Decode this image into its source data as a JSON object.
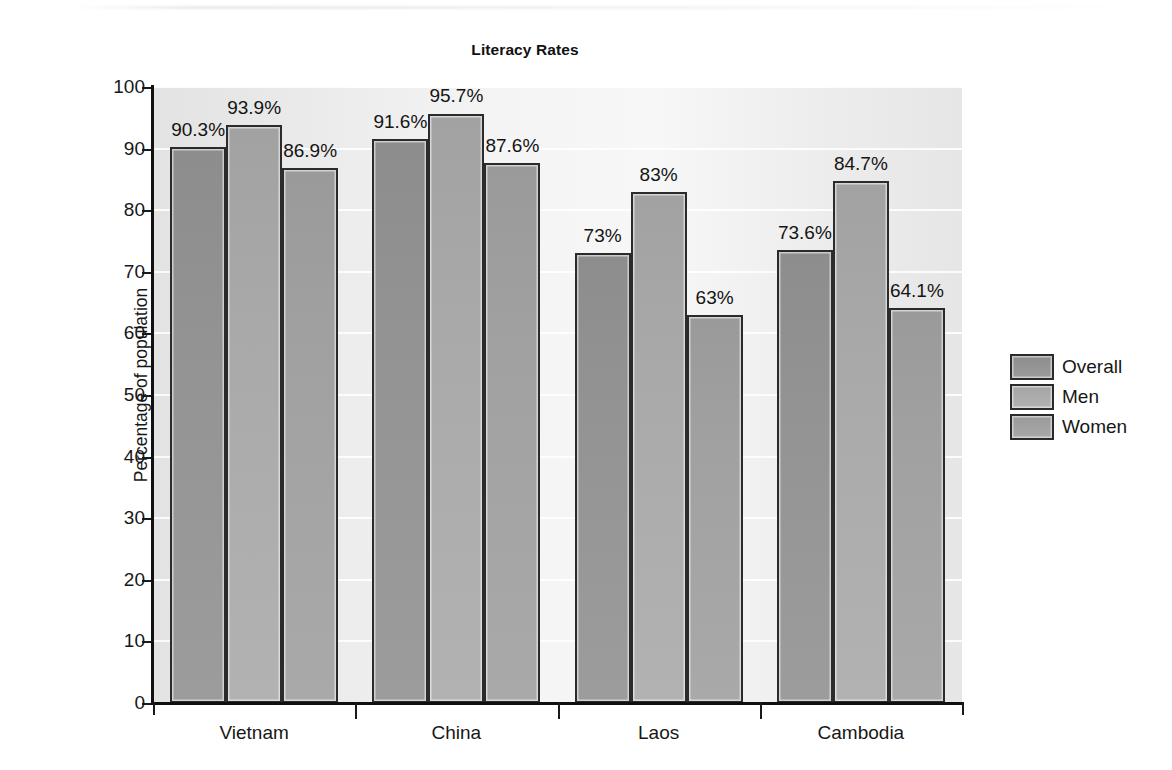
{
  "chart_data": {
    "type": "bar",
    "title": "Literacy Rates",
    "xlabel": "",
    "ylabel": "Percentage of population",
    "ylim": [
      0,
      100
    ],
    "ytick_step": 10,
    "yticks": [
      100,
      90,
      80,
      70,
      60,
      50,
      40,
      30,
      20,
      10,
      0
    ],
    "ytick_labels": [
      "100",
      "90",
      "80",
      "70",
      "60",
      "50",
      "40",
      "30",
      "20",
      "10",
      "0"
    ],
    "grid": "horizontal-white",
    "legend_position": "right",
    "categories": [
      "Vietnam",
      "China",
      "Laos",
      "Cambodia"
    ],
    "series": [
      {
        "name": "Overall",
        "color": "#939393",
        "values": [
          90.3,
          91.6,
          73,
          73.6
        ],
        "labels": [
          "90.3%",
          "91.6%",
          "73%",
          "73.6%"
        ]
      },
      {
        "name": "Men",
        "color": "#a9a9a9",
        "values": [
          93.9,
          95.7,
          83,
          84.7
        ],
        "labels": [
          "93.9%",
          "95.7%",
          "83%",
          "84.7%"
        ]
      },
      {
        "name": "Women",
        "color": "#a1a1a1",
        "values": [
          86.9,
          87.6,
          63,
          64.1
        ],
        "labels": [
          "86.9%",
          "87.6%",
          "63%",
          "64.1%"
        ]
      }
    ]
  },
  "legend": {
    "items": [
      {
        "label": "Overall"
      },
      {
        "label": "Men"
      },
      {
        "label": "Women"
      }
    ]
  }
}
